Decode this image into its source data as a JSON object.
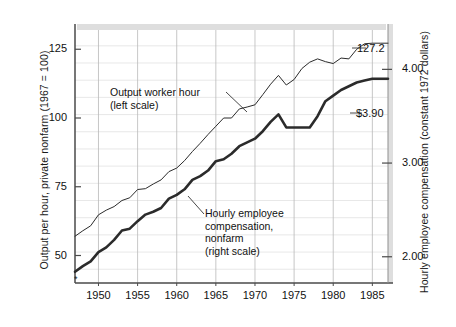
{
  "chart_data": {
    "type": "line",
    "title": "",
    "ylabel_left": "Output per hour, private nonfarm (1967 = 100)",
    "ylabel_right": "Hourly employee compensation (constant 1972 dollars)",
    "xlabel": "",
    "xlim": [
      1947,
      1987
    ],
    "ylim_left": [
      40,
      132
    ],
    "ylim_right": [
      1.72,
      4.42
    ],
    "grid": true,
    "legend_position": "inline-annotations",
    "left_ticks": [
      "125",
      "100",
      "75",
      "50"
    ],
    "left_tick_values": [
      125,
      100,
      75,
      50
    ],
    "right_ticks": [
      "4.00",
      "3.00",
      "2.00"
    ],
    "right_tick_values": [
      4.0,
      3.0,
      2.0
    ],
    "x_ticks": [
      "1950",
      "1955",
      "1960",
      "1965",
      "1970",
      "1975",
      "1980",
      "1985"
    ],
    "x_tick_values": [
      1950,
      1955,
      1960,
      1965,
      1970,
      1975,
      1980,
      1985
    ],
    "annotations": [
      {
        "id": "output-annotation",
        "text": "Output worker hour\n(left scale)"
      },
      {
        "id": "compensation-annotation",
        "text": "Hourly employee\ncompensation,\nnonfarm\n(right scale)"
      }
    ],
    "end_labels": [
      {
        "id": "output-end-label",
        "text": "127.2"
      },
      {
        "id": "compensation-end-label",
        "text": "$3.90"
      }
    ],
    "series": [
      {
        "name": "Output worker hour (left scale)",
        "axis": "left",
        "color": "#2b2b2b",
        "stroke_width": 1.0,
        "x": [
          1947,
          1948,
          1949,
          1950,
          1951,
          1952,
          1953,
          1954,
          1955,
          1956,
          1957,
          1958,
          1959,
          1960,
          1961,
          1962,
          1963,
          1964,
          1965,
          1966,
          1967,
          1968,
          1969,
          1970,
          1971,
          1972,
          1973,
          1974,
          1975,
          1976,
          1977,
          1978,
          1979,
          1980,
          1981,
          1982,
          1983,
          1984,
          1985,
          1986,
          1987
        ],
        "values": [
          57.0,
          59.0,
          60.8,
          64.8,
          66.5,
          67.8,
          70.0,
          71.0,
          74.0,
          74.3,
          76.0,
          77.5,
          80.5,
          81.8,
          84.5,
          87.8,
          90.8,
          94.0,
          97.0,
          100.0,
          100.0,
          103.3,
          104.0,
          104.8,
          108.5,
          112.3,
          115.5,
          112.0,
          114.0,
          118.0,
          120.3,
          121.5,
          120.5,
          119.8,
          121.8,
          121.5,
          125.0,
          127.0,
          127.2,
          127.2,
          127.2
        ]
      },
      {
        "name": "Hourly employee compensation, nonfarm (right scale)",
        "axis": "right",
        "color": "#2b2b2b",
        "stroke_width": 2.6,
        "x": [
          1947,
          1948,
          1949,
          1950,
          1951,
          1952,
          1953,
          1954,
          1955,
          1956,
          1957,
          1958,
          1959,
          1960,
          1961,
          1962,
          1963,
          1964,
          1965,
          1966,
          1967,
          1968,
          1969,
          1970,
          1971,
          1972,
          1973,
          1974,
          1975,
          1976,
          1977,
          1978,
          1979,
          1980,
          1981,
          1982,
          1983,
          1984,
          1985,
          1986,
          1987
        ],
        "values": [
          1.84,
          1.9,
          1.95,
          2.05,
          2.1,
          2.18,
          2.28,
          2.3,
          2.38,
          2.45,
          2.48,
          2.52,
          2.62,
          2.66,
          2.72,
          2.82,
          2.86,
          2.92,
          3.02,
          3.04,
          3.1,
          3.18,
          3.22,
          3.26,
          3.34,
          3.44,
          3.52,
          3.38,
          3.38,
          3.38,
          3.38,
          3.5,
          3.66,
          3.72,
          3.78,
          3.82,
          3.86,
          3.88,
          3.9,
          3.9,
          3.9
        ]
      }
    ]
  },
  "plot_area": {
    "left_px": 75,
    "right_px": 388,
    "top_px": 30,
    "bottom_px": 283
  }
}
